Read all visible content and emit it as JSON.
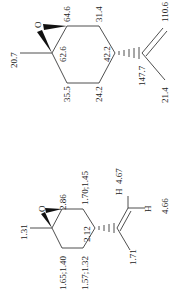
{
  "structures": [
    {
      "name": "limonene-oxide-13C",
      "atom_label": "O",
      "shifts": {
        "methyl": "20.7",
        "c1": "62.6",
        "c2": "64.6",
        "c3": "31.4",
        "c4": "42.2",
        "c5": "24.2",
        "c6": "35.5",
        "c8": "147.7",
        "c9": "110.6",
        "c10": "21.4"
      }
    },
    {
      "name": "limonene-oxide-1H",
      "atom_label": "O",
      "h_label_a": "H",
      "h_label_b": "H",
      "shifts": {
        "methyl": "1.31",
        "h2": "2.86",
        "h3": "1.70;1.45",
        "h4": "2.12",
        "h5": "1.57;1.32",
        "h6": "1.65;1.40",
        "h9a": "4.67",
        "h9b": "4.66",
        "h10": "1.71"
      }
    }
  ]
}
